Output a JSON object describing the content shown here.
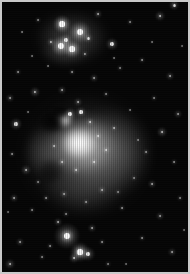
{
  "image": {
    "subject": "Orion Nebula (M42) and Running Man Nebula (NGC 1977)",
    "alt_text": "Black and white astrophotograph of the Orion Nebula region",
    "width_px": 190,
    "height_px": 274,
    "orientation": "portrait",
    "color_mode": "grayscale",
    "frame": {
      "border_color": "#c9c9c9",
      "border_width_px": 2,
      "background_color": "#050505"
    },
    "artifacts": {
      "vertical_streaking": "true",
      "sensor_grain": "true"
    }
  },
  "nebulae": [
    {
      "name": "running-man-nebula",
      "label": "NGC 1977",
      "cx": 70,
      "cy": 36,
      "rx": 36,
      "ry": 26,
      "peak_color": "#8e8e8e",
      "brightness": 0.42
    },
    {
      "name": "running-man-lower-lobe",
      "label": "NGC 1977 south lobe",
      "cx": 62,
      "cy": 50,
      "rx": 24,
      "ry": 14,
      "peak_color": "#6a6a6a",
      "brightness": 0.3
    },
    {
      "name": "orion-nebula-outer-halo",
      "label": "M42 outer halo",
      "cx": 84,
      "cy": 152,
      "rx": 62,
      "ry": 58,
      "peak_color": "#7a7a7a",
      "brightness": 0.45
    },
    {
      "name": "orion-nebula-east-wing",
      "label": "M42 east wing",
      "cx": 108,
      "cy": 150,
      "rx": 40,
      "ry": 42,
      "peak_color": "#909090",
      "brightness": 0.5
    },
    {
      "name": "orion-nebula-south-extension",
      "label": "M42 south extension",
      "cx": 82,
      "cy": 182,
      "rx": 40,
      "ry": 30,
      "peak_color": "#6e6e6e",
      "brightness": 0.38
    },
    {
      "name": "orion-nebula-inner-glow",
      "label": "M42 inner glow",
      "cx": 80,
      "cy": 144,
      "rx": 34,
      "ry": 30,
      "peak_color": "#d2d2d2",
      "brightness": 0.82
    },
    {
      "name": "orion-nebula-core",
      "label": "M42 Trapezium core",
      "cx": 77,
      "cy": 141,
      "rx": 18,
      "ry": 15,
      "peak_color": "#ffffff",
      "brightness": 1.0
    },
    {
      "name": "orion-nebula-bright-knot",
      "label": "M42 northern knot",
      "cx": 62,
      "cy": 118,
      "rx": 9,
      "ry": 8,
      "peak_color": "#f2f2f2",
      "brightness": 0.9
    },
    {
      "name": "orion-nebula-west-arc",
      "label": "M42 west arc",
      "cx": 44,
      "cy": 150,
      "rx": 22,
      "ry": 26,
      "peak_color": "#787878",
      "brightness": 0.4
    }
  ],
  "dust_lanes": [
    {
      "name": "fish-mouth-dark-lane",
      "label": "Fish Mouth dark lane",
      "cx": 50,
      "cy": 120,
      "rx": 13,
      "ry": 11,
      "opacity": 0.95
    },
    {
      "name": "dark-lane-north",
      "label": "north dust intrusion",
      "cx": 58,
      "cy": 110,
      "rx": 10,
      "ry": 7,
      "opacity": 0.8
    },
    {
      "name": "dark-lane-southwest",
      "label": "southwest dust notch",
      "cx": 48,
      "cy": 170,
      "rx": 12,
      "ry": 12,
      "opacity": 0.55
    }
  ],
  "stars": [
    {
      "x": 60,
      "y": 22,
      "r": 2.6,
      "glow": 9,
      "b": 1.0,
      "n": "ngc1977-star-a"
    },
    {
      "x": 78,
      "y": 30,
      "r": 3.2,
      "glow": 11,
      "b": 1.0,
      "n": "ngc1977-star-b"
    },
    {
      "x": 59,
      "y": 44,
      "r": 3.0,
      "glow": 10,
      "b": 1.0,
      "n": "ngc1977-star-c"
    },
    {
      "x": 70,
      "y": 47,
      "r": 2.6,
      "glow": 9,
      "b": 0.95,
      "n": "ngc1977-star-d"
    },
    {
      "x": 64,
      "y": 38,
      "r": 1.7,
      "glow": 6,
      "b": 0.85,
      "n": "ngc1977-star-e"
    },
    {
      "x": 86,
      "y": 36,
      "r": 1.5,
      "glow": 5,
      "b": 0.8,
      "n": "ngc1977-star-f"
    },
    {
      "x": 49,
      "y": 40,
      "r": 1.3,
      "glow": 4,
      "b": 0.7,
      "n": "ngc1977-star-g"
    },
    {
      "x": 83,
      "y": 52,
      "r": 1.1,
      "glow": 3,
      "b": 0.6,
      "n": "ngc1977-star-h"
    },
    {
      "x": 110,
      "y": 42,
      "r": 1.8,
      "glow": 6,
      "b": 0.85,
      "n": "field-star-n1"
    },
    {
      "x": 158,
      "y": 14,
      "r": 1.4,
      "glow": 5,
      "b": 0.75,
      "n": "field-star-n2"
    },
    {
      "x": 172,
      "y": 3,
      "r": 1.5,
      "glow": 5,
      "b": 0.8,
      "n": "field-star-n3"
    },
    {
      "x": 96,
      "y": 12,
      "r": 1.2,
      "glow": 4,
      "b": 0.65,
      "n": "field-star-n4"
    },
    {
      "x": 128,
      "y": 20,
      "r": 0.9,
      "glow": 3,
      "b": 0.5,
      "n": "field-star-n5"
    },
    {
      "x": 36,
      "y": 18,
      "r": 0.9,
      "glow": 3,
      "b": 0.5,
      "n": "field-star-n6"
    },
    {
      "x": 20,
      "y": 30,
      "r": 0.8,
      "glow": 2,
      "b": 0.45,
      "n": "field-star-n7"
    },
    {
      "x": 16,
      "y": 70,
      "r": 1.0,
      "glow": 3,
      "b": 0.55,
      "n": "field-star-w1"
    },
    {
      "x": 8,
      "y": 96,
      "r": 1.1,
      "glow": 4,
      "b": 0.6,
      "n": "field-star-w2"
    },
    {
      "x": 33,
      "y": 90,
      "r": 1.4,
      "glow": 5,
      "b": 0.72,
      "n": "field-star-w3"
    },
    {
      "x": 14,
      "y": 122,
      "r": 1.6,
      "glow": 6,
      "b": 0.8,
      "n": "field-star-w4"
    },
    {
      "x": 10,
      "y": 152,
      "r": 1.0,
      "glow": 3,
      "b": 0.55,
      "n": "field-star-w5"
    },
    {
      "x": 24,
      "y": 168,
      "r": 1.3,
      "glow": 5,
      "b": 0.68,
      "n": "field-star-w6"
    },
    {
      "x": 12,
      "y": 196,
      "r": 1.2,
      "glow": 4,
      "b": 0.62,
      "n": "field-star-w7"
    },
    {
      "x": 30,
      "y": 208,
      "r": 0.9,
      "glow": 3,
      "b": 0.5,
      "n": "field-star-w8"
    },
    {
      "x": 18,
      "y": 240,
      "r": 1.1,
      "glow": 4,
      "b": 0.58,
      "n": "field-star-w9"
    },
    {
      "x": 8,
      "y": 262,
      "r": 1.3,
      "glow": 5,
      "b": 0.68,
      "n": "field-star-w10"
    },
    {
      "x": 40,
      "y": 255,
      "r": 0.9,
      "glow": 3,
      "b": 0.5,
      "n": "field-star-w11"
    },
    {
      "x": 70,
      "y": 70,
      "r": 1.0,
      "glow": 3,
      "b": 0.55,
      "n": "field-star-m1"
    },
    {
      "x": 92,
      "y": 76,
      "r": 1.1,
      "glow": 4,
      "b": 0.6,
      "n": "field-star-m2"
    },
    {
      "x": 60,
      "y": 88,
      "r": 1.2,
      "glow": 4,
      "b": 0.62,
      "n": "field-star-m3"
    },
    {
      "x": 104,
      "y": 92,
      "r": 0.9,
      "glow": 3,
      "b": 0.5,
      "n": "field-star-m4"
    },
    {
      "x": 76,
      "y": 100,
      "r": 1.3,
      "glow": 4,
      "b": 0.66,
      "n": "field-star-m5"
    },
    {
      "x": 118,
      "y": 66,
      "r": 0.9,
      "glow": 3,
      "b": 0.48,
      "n": "field-star-m6"
    },
    {
      "x": 46,
      "y": 64,
      "r": 0.8,
      "glow": 2,
      "b": 0.44,
      "n": "field-star-m7"
    },
    {
      "x": 68,
      "y": 112,
      "r": 1.8,
      "glow": 6,
      "b": 0.92,
      "n": "m42-star-core-n1"
    },
    {
      "x": 79,
      "y": 110,
      "r": 1.6,
      "glow": 5,
      "b": 0.88,
      "n": "m42-star-core-n2"
    },
    {
      "x": 88,
      "y": 120,
      "r": 1.2,
      "glow": 4,
      "b": 0.78,
      "n": "m42-star-core-n3"
    },
    {
      "x": 96,
      "y": 134,
      "r": 1.1,
      "glow": 4,
      "b": 0.75,
      "n": "m42-star-core-e1"
    },
    {
      "x": 104,
      "y": 148,
      "r": 1.2,
      "glow": 4,
      "b": 0.76,
      "n": "m42-star-core-e2"
    },
    {
      "x": 92,
      "y": 160,
      "r": 1.3,
      "glow": 4,
      "b": 0.78,
      "n": "m42-star-core-s1"
    },
    {
      "x": 74,
      "y": 168,
      "r": 1.2,
      "glow": 4,
      "b": 0.74,
      "n": "m42-star-core-s2"
    },
    {
      "x": 60,
      "y": 160,
      "r": 1.1,
      "glow": 4,
      "b": 0.7,
      "n": "m42-star-core-s3"
    },
    {
      "x": 112,
      "y": 126,
      "r": 1.0,
      "glow": 3,
      "b": 0.66,
      "n": "m42-star-core-e3"
    },
    {
      "x": 52,
      "y": 144,
      "r": 1.0,
      "glow": 3,
      "b": 0.64,
      "n": "m42-star-core-w1"
    },
    {
      "x": 140,
      "y": 58,
      "r": 1.0,
      "glow": 3,
      "b": 0.55,
      "n": "field-star-e1"
    },
    {
      "x": 168,
      "y": 74,
      "r": 1.2,
      "glow": 4,
      "b": 0.62,
      "n": "field-star-e2"
    },
    {
      "x": 152,
      "y": 96,
      "r": 0.9,
      "glow": 3,
      "b": 0.5,
      "n": "field-star-e3"
    },
    {
      "x": 176,
      "y": 112,
      "r": 1.1,
      "glow": 4,
      "b": 0.58,
      "n": "field-star-e4"
    },
    {
      "x": 160,
      "y": 130,
      "r": 1.4,
      "glow": 5,
      "b": 0.72,
      "n": "field-star-e5"
    },
    {
      "x": 144,
      "y": 150,
      "r": 1.0,
      "glow": 3,
      "b": 0.55,
      "n": "field-star-e6"
    },
    {
      "x": 172,
      "y": 160,
      "r": 1.0,
      "glow": 3,
      "b": 0.54,
      "n": "field-star-e7"
    },
    {
      "x": 150,
      "y": 182,
      "r": 1.2,
      "glow": 4,
      "b": 0.62,
      "n": "field-star-e8"
    },
    {
      "x": 178,
      "y": 196,
      "r": 0.9,
      "glow": 3,
      "b": 0.5,
      "n": "field-star-e9"
    },
    {
      "x": 158,
      "y": 214,
      "r": 1.1,
      "glow": 4,
      "b": 0.58,
      "n": "field-star-e10"
    },
    {
      "x": 140,
      "y": 236,
      "r": 1.0,
      "glow": 3,
      "b": 0.54,
      "n": "field-star-e11"
    },
    {
      "x": 170,
      "y": 250,
      "r": 1.2,
      "glow": 4,
      "b": 0.6,
      "n": "field-star-e12"
    },
    {
      "x": 120,
      "y": 206,
      "r": 1.0,
      "glow": 3,
      "b": 0.55,
      "n": "field-star-e13"
    },
    {
      "x": 132,
      "y": 176,
      "r": 0.9,
      "glow": 3,
      "b": 0.48,
      "n": "field-star-e14"
    },
    {
      "x": 65,
      "y": 234,
      "r": 3.4,
      "glow": 13,
      "b": 1.0,
      "n": "bright-star-south-primary"
    },
    {
      "x": 78,
      "y": 250,
      "r": 2.6,
      "glow": 10,
      "b": 0.98,
      "n": "bright-star-south-b"
    },
    {
      "x": 86,
      "y": 252,
      "r": 1.8,
      "glow": 7,
      "b": 0.88,
      "n": "bright-star-south-c"
    },
    {
      "x": 72,
      "y": 256,
      "r": 1.4,
      "glow": 5,
      "b": 0.76,
      "n": "bright-star-south-d"
    },
    {
      "x": 56,
      "y": 220,
      "r": 1.2,
      "glow": 4,
      "b": 0.66,
      "n": "bright-star-south-e"
    },
    {
      "x": 90,
      "y": 226,
      "r": 1.1,
      "glow": 4,
      "b": 0.62,
      "n": "bright-star-south-f"
    },
    {
      "x": 100,
      "y": 240,
      "r": 1.0,
      "glow": 3,
      "b": 0.55,
      "n": "bright-star-south-g"
    },
    {
      "x": 48,
      "y": 244,
      "r": 1.0,
      "glow": 3,
      "b": 0.54,
      "n": "bright-star-south-h"
    },
    {
      "x": 64,
      "y": 212,
      "r": 0.9,
      "glow": 3,
      "b": 0.5,
      "n": "bright-star-south-i"
    },
    {
      "x": 106,
      "y": 262,
      "r": 0.9,
      "glow": 3,
      "b": 0.48,
      "n": "bright-star-south-j"
    },
    {
      "x": 44,
      "y": 196,
      "r": 1.0,
      "glow": 3,
      "b": 0.55,
      "n": "field-star-s1"
    },
    {
      "x": 62,
      "y": 192,
      "r": 1.1,
      "glow": 4,
      "b": 0.58,
      "n": "field-star-s2"
    },
    {
      "x": 84,
      "y": 200,
      "r": 1.0,
      "glow": 3,
      "b": 0.55,
      "n": "field-star-s3"
    },
    {
      "x": 100,
      "y": 188,
      "r": 1.2,
      "glow": 4,
      "b": 0.62,
      "n": "field-star-s4"
    },
    {
      "x": 116,
      "y": 190,
      "r": 0.9,
      "glow": 3,
      "b": 0.48,
      "n": "field-star-s5"
    },
    {
      "x": 36,
      "y": 180,
      "r": 0.9,
      "glow": 3,
      "b": 0.5,
      "n": "field-star-s6"
    },
    {
      "x": 128,
      "y": 108,
      "r": 0.8,
      "glow": 2,
      "b": 0.44,
      "n": "field-star-x1"
    },
    {
      "x": 136,
      "y": 138,
      "r": 0.8,
      "glow": 2,
      "b": 0.44,
      "n": "field-star-x2"
    },
    {
      "x": 26,
      "y": 110,
      "r": 0.8,
      "glow": 2,
      "b": 0.42,
      "n": "field-star-x3"
    },
    {
      "x": 30,
      "y": 54,
      "r": 0.8,
      "glow": 2,
      "b": 0.42,
      "n": "field-star-x4"
    },
    {
      "x": 112,
      "y": 56,
      "r": 0.8,
      "glow": 2,
      "b": 0.42,
      "n": "field-star-x5"
    },
    {
      "x": 150,
      "y": 40,
      "r": 0.8,
      "glow": 2,
      "b": 0.42,
      "n": "field-star-x6"
    },
    {
      "x": 180,
      "y": 44,
      "r": 0.8,
      "glow": 2,
      "b": 0.4,
      "n": "field-star-x7"
    },
    {
      "x": 182,
      "y": 228,
      "r": 0.8,
      "glow": 2,
      "b": 0.4,
      "n": "field-star-x8"
    },
    {
      "x": 124,
      "y": 262,
      "r": 0.8,
      "glow": 2,
      "b": 0.4,
      "n": "field-star-x9"
    },
    {
      "x": 6,
      "y": 210,
      "r": 0.8,
      "glow": 2,
      "b": 0.4,
      "n": "field-star-x10"
    }
  ]
}
